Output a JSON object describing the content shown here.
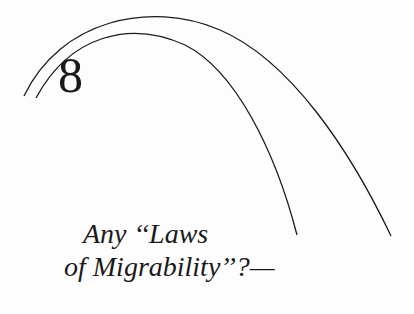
{
  "chapter": {
    "number": "8",
    "title_line1": "Any ‘‘Laws",
    "title_line2": "of Migrability’’?—"
  },
  "colors": {
    "ink": "#1a1a1a",
    "paper": "#fdfdfd"
  }
}
